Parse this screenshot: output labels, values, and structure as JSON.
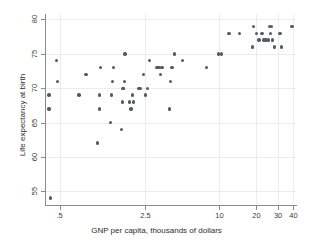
{
  "chart_data": {
    "type": "scatter",
    "title": "",
    "xlabel": "GNP per capita, thousands of dollars",
    "ylabel": "Life expectancy at birth",
    "xscale": "log",
    "xlim": [
      0.38,
      42
    ],
    "ylim": [
      53,
      80.8
    ],
    "grid": true,
    "legend": null,
    "xticks": [
      0.5,
      2.5,
      10,
      20,
      30,
      40
    ],
    "xticklabels": [
      ".5",
      "2.5",
      "10",
      "20",
      "30",
      "40"
    ],
    "yticks": [
      55,
      60,
      65,
      70,
      75,
      80
    ],
    "yticklabels": [
      "55",
      "60",
      "65",
      "70",
      "75",
      "80"
    ],
    "marker_color": "#555a60",
    "points": [
      {
        "x": 0.42,
        "y": 54
      },
      {
        "x": 0.41,
        "y": 67
      },
      {
        "x": 0.41,
        "y": 69
      },
      {
        "x": 0.48,
        "y": 71
      },
      {
        "x": 0.47,
        "y": 74
      },
      {
        "x": 0.72,
        "y": 69
      },
      {
        "x": 0.82,
        "y": 72
      },
      {
        "x": 1.02,
        "y": 62
      },
      {
        "x": 1.05,
        "y": 67
      },
      {
        "x": 1.05,
        "y": 69
      },
      {
        "x": 1.08,
        "y": 73
      },
      {
        "x": 1.3,
        "y": 65
      },
      {
        "x": 1.32,
        "y": 69
      },
      {
        "x": 1.35,
        "y": 71
      },
      {
        "x": 1.38,
        "y": 73
      },
      {
        "x": 1.6,
        "y": 64
      },
      {
        "x": 1.62,
        "y": 68
      },
      {
        "x": 1.64,
        "y": 70
      },
      {
        "x": 1.66,
        "y": 70
      },
      {
        "x": 1.68,
        "y": 71
      },
      {
        "x": 1.7,
        "y": 75
      },
      {
        "x": 1.85,
        "y": 68
      },
      {
        "x": 1.9,
        "y": 67
      },
      {
        "x": 1.95,
        "y": 69
      },
      {
        "x": 2.0,
        "y": 68
      },
      {
        "x": 2.2,
        "y": 70
      },
      {
        "x": 2.25,
        "y": 70
      },
      {
        "x": 2.4,
        "y": 72
      },
      {
        "x": 2.5,
        "y": 69
      },
      {
        "x": 2.6,
        "y": 70
      },
      {
        "x": 2.7,
        "y": 74
      },
      {
        "x": 3.1,
        "y": 73
      },
      {
        "x": 3.2,
        "y": 73
      },
      {
        "x": 3.25,
        "y": 73
      },
      {
        "x": 3.3,
        "y": 72
      },
      {
        "x": 3.4,
        "y": 73
      },
      {
        "x": 3.9,
        "y": 67
      },
      {
        "x": 4.0,
        "y": 71
      },
      {
        "x": 4.1,
        "y": 73
      },
      {
        "x": 4.3,
        "y": 75
      },
      {
        "x": 5.0,
        "y": 74
      },
      {
        "x": 7.8,
        "y": 73
      },
      {
        "x": 9.8,
        "y": 75
      },
      {
        "x": 10.4,
        "y": 75
      },
      {
        "x": 12.0,
        "y": 78
      },
      {
        "x": 14.5,
        "y": 78
      },
      {
        "x": 18.5,
        "y": 76
      },
      {
        "x": 19.0,
        "y": 79
      },
      {
        "x": 20.0,
        "y": 78
      },
      {
        "x": 21.0,
        "y": 77
      },
      {
        "x": 22.0,
        "y": 78
      },
      {
        "x": 22.5,
        "y": 78
      },
      {
        "x": 23.0,
        "y": 77
      },
      {
        "x": 24.0,
        "y": 77
      },
      {
        "x": 25.0,
        "y": 77
      },
      {
        "x": 25.5,
        "y": 79
      },
      {
        "x": 26.0,
        "y": 78
      },
      {
        "x": 26.5,
        "y": 79
      },
      {
        "x": 27.0,
        "y": 77
      },
      {
        "x": 28.0,
        "y": 76
      },
      {
        "x": 31.0,
        "y": 78
      },
      {
        "x": 32.0,
        "y": 76
      },
      {
        "x": 39.0,
        "y": 79
      }
    ]
  }
}
